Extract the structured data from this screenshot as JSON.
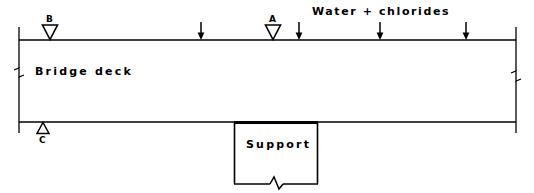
{
  "diagram": {
    "deck": {
      "label": "Bridge deck",
      "left": 19,
      "right": 516,
      "top": 40,
      "bottom": 122
    },
    "support": {
      "label": "Support",
      "left": 234,
      "right": 318,
      "top": 122,
      "bottom": 184
    },
    "exposure": {
      "label": "Water + chlorides",
      "text_x": 312,
      "text_y": 6,
      "arrows": [
        {
          "name": "chloride-arrow-1",
          "x": 201,
          "y_top": 22,
          "y_bottom": 40
        },
        {
          "name": "chloride-arrow-2",
          "x": 299,
          "y_top": 22,
          "y_bottom": 40
        },
        {
          "name": "chloride-arrow-3",
          "x": 380,
          "y_top": 22,
          "y_bottom": 40
        },
        {
          "name": "chloride-arrow-4",
          "x": 466,
          "y_top": 22,
          "y_bottom": 40
        }
      ]
    },
    "markers": [
      {
        "id": "A",
        "label": "A",
        "name": "marker-a",
        "shape": "triangle-down-hollow",
        "x": 273,
        "tip_y": 40,
        "label_x": 269,
        "label_y": 15
      },
      {
        "id": "B",
        "label": "B",
        "name": "marker-b",
        "shape": "triangle-down-hollow",
        "x": 50,
        "tip_y": 40,
        "label_x": 46,
        "label_y": 15
      },
      {
        "id": "C",
        "label": "C",
        "name": "marker-c",
        "shape": "triangle-up-hollow",
        "x": 43,
        "tip_y": 122,
        "label_x": 39,
        "label_y": 138
      }
    ],
    "break_marks": [
      {
        "name": "break-mark-left",
        "x": 19,
        "y": 72
      },
      {
        "name": "break-mark-right",
        "x": 516,
        "y": 76
      },
      {
        "name": "break-mark-support-bottom",
        "x": 276,
        "y": 184
      }
    ],
    "colors": {
      "line": "#000000",
      "text": "#000000",
      "background": "#ffffff"
    }
  }
}
